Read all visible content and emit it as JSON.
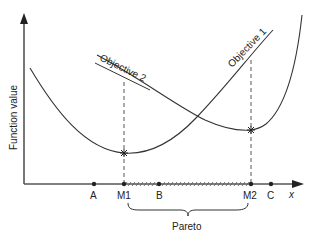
{
  "diagram": {
    "y_axis_label": "Function value",
    "x_axis_label": "x",
    "curves": [
      {
        "name": "Objective 1",
        "label": "Objective 1"
      },
      {
        "name": "Objective 2",
        "label": "Objective 2"
      }
    ],
    "points": {
      "A": "A",
      "M1": "M1",
      "B": "B",
      "M2": "M2",
      "C": "C"
    },
    "pareto_label": "Pareto",
    "colors": {
      "line": "#333333",
      "axis": "#444444",
      "background": "#ffffff"
    }
  }
}
